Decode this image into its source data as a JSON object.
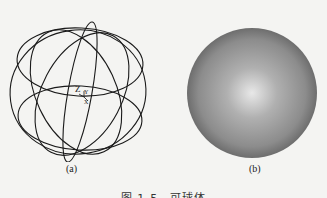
{
  "figure": {
    "caption": "图 1-5　可球体",
    "panels": [
      {
        "label": "(a)",
        "kind": "wireframe-sphere",
        "axis_labels": {
          "z": "Z",
          "y": "Y",
          "x": "X"
        }
      },
      {
        "label": "(b)",
        "kind": "shaded-sphere"
      }
    ]
  },
  "colors": {
    "background": "#f4f4f2",
    "wire": "#1a1a1a",
    "sphere_highlight": "#e8e8e8",
    "sphere_mid": "#9a9a9a",
    "sphere_edge": "#5c5c5c"
  }
}
